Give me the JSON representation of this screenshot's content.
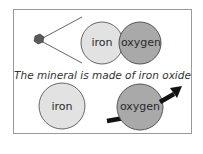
{
  "diagram": {
    "caption": "The mineral is made of iron oxide",
    "top": {
      "grain_icon": "mineral-grain",
      "left_circle": {
        "label": "iron",
        "color": "#e2e2e2"
      },
      "right_circle": {
        "label": "oxygen",
        "color": "#a9a9a9"
      }
    },
    "bottom": {
      "left_circle": {
        "label": "iron",
        "color": "#e2e2e2"
      },
      "right_circle": {
        "label": "oxygen",
        "color": "#a9a9a9"
      },
      "arrow": "arrow-up-right"
    },
    "colors": {
      "border": "#9a9a9a",
      "outline": "#555555",
      "arrow": "#111111",
      "grain": "#555555"
    }
  }
}
